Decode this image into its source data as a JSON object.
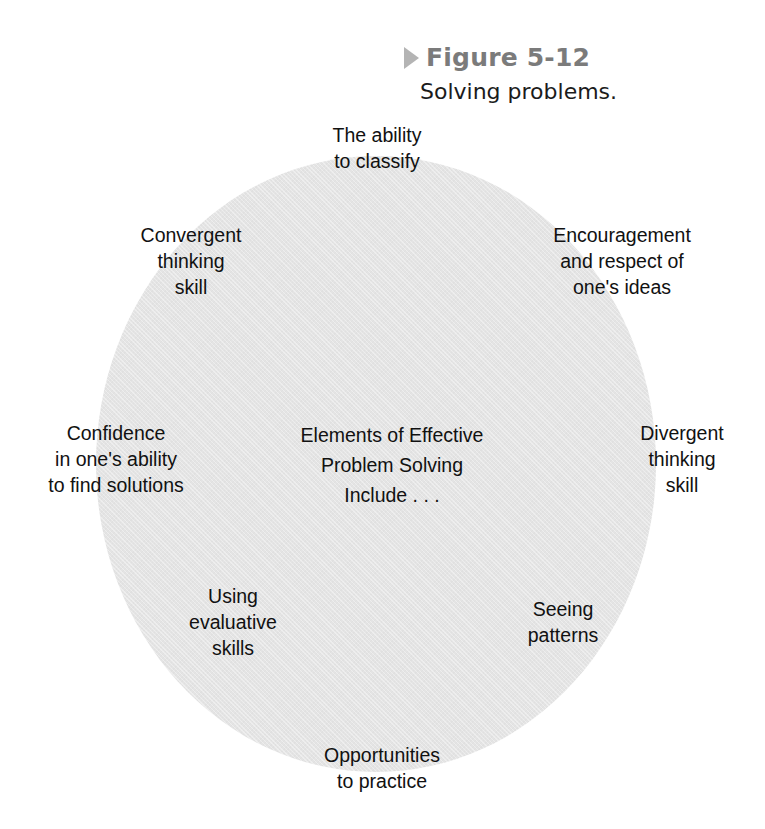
{
  "figure": {
    "marker_icon": "triangle-right-icon",
    "number_label": "Figure 5-12",
    "title": "Solving problems."
  },
  "diagram": {
    "shape": "circle",
    "fill_color": "#e4e4e4",
    "text_color": "#111111",
    "center_label": "Elements of Effective\nProblem Solving\nInclude . . .",
    "labels": [
      {
        "id": "classify",
        "text": "The ability\nto classify",
        "position": "top"
      },
      {
        "id": "convergent",
        "text": "Convergent\nthinking\nskill",
        "position": "upper-left"
      },
      {
        "id": "encouragement",
        "text": "Encouragement\nand respect of\none's ideas",
        "position": "upper-right"
      },
      {
        "id": "confidence",
        "text": "Confidence\nin one's ability\nto find solutions",
        "position": "left"
      },
      {
        "id": "divergent",
        "text": "Divergent\nthinking\nskill",
        "position": "right"
      },
      {
        "id": "evaluative",
        "text": "Using\nevaluative\nskills",
        "position": "lower-left"
      },
      {
        "id": "patterns",
        "text": "Seeing\npatterns",
        "position": "lower-right"
      },
      {
        "id": "opportunities",
        "text": "Opportunities\nto practice",
        "position": "bottom"
      }
    ]
  }
}
